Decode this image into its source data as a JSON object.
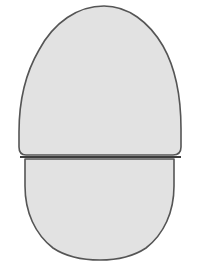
{
  "figure": {
    "type": "line-drawing",
    "background_color": "#ffffff",
    "canvas": {
      "width": 197,
      "height": 280
    },
    "style": {
      "fill_color": "#e2e2e2",
      "stroke_color": "#555555",
      "stroke_width": 1.6,
      "divider_stroke_color": "#3d3d3d",
      "divider_stroke_width": 1.8
    },
    "pieces": [
      {
        "name": "upper-shell",
        "label": "Upper piece",
        "fill": "#e2e2e2",
        "stroke": "#555555",
        "path": "M 104 6 C 128 6 149 22 163 46 C 176 69 181 100 181 129 L 181 147 Q 181 155 173 155 L 26 155 Q 19 155 19 147 L 19 132 C 19 104 25 74 39 50 C 54 22 78 6 104 6 Z"
      },
      {
        "name": "lower-shell",
        "label": "Lower piece",
        "fill": "#e2e2e2",
        "stroke": "#555555",
        "path": "M 26 159 L 174 159 L 174 186 C 174 212 164 234 146 248 C 134 256 120 260 100 260 C 80 260 65 256 53 248 C 35 234 25 212 25 186 L 25 159 Z"
      }
    ],
    "divider": {
      "name": "split-line",
      "label": "Split between pieces",
      "y": 157,
      "x1": 20,
      "x2": 181
    }
  }
}
